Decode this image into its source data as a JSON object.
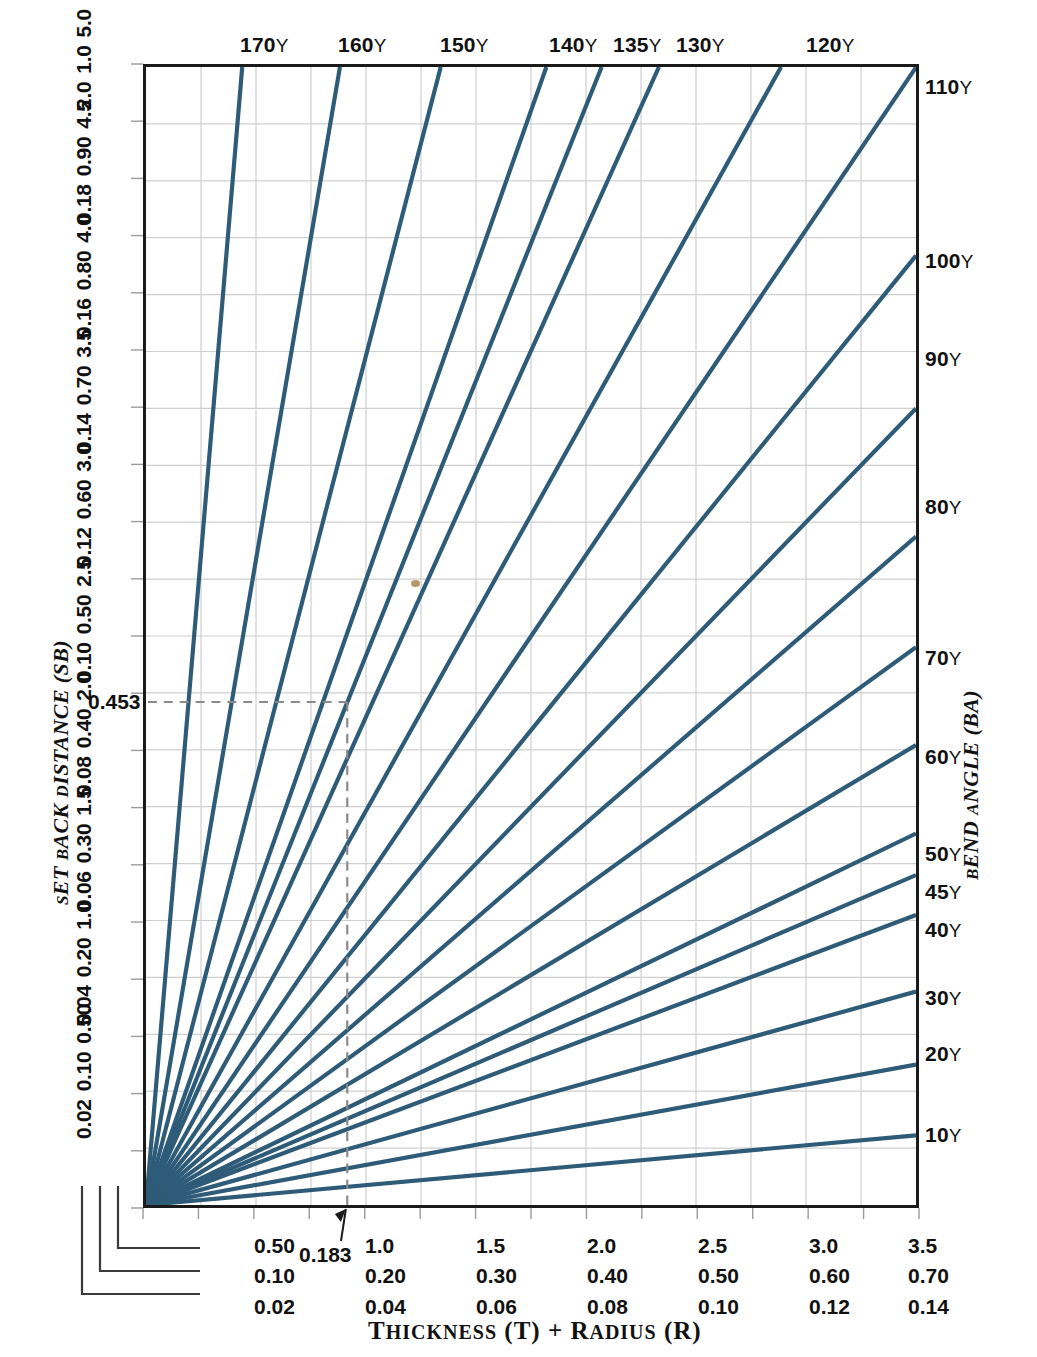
{
  "figure": {
    "x_axis_title": "THICKNESS (T) + RADIUS (R)",
    "y_axis_title": "SET BACK DISTANCE (SB)",
    "right_axis_title": "BEND ANGLE (BA)",
    "degree_symbol": "Υ",
    "line_color": "#2d5b78",
    "grid_color": "#cfcfcf",
    "frame_color": "#1a1a1a",
    "dashed_color": "#8a8a8a"
  },
  "top_labels": [
    {
      "text": "170",
      "deg": "Υ",
      "x": 240
    },
    {
      "text": "160",
      "deg": "Υ",
      "x": 338
    },
    {
      "text": "150",
      "deg": "Υ",
      "x": 440
    },
    {
      "text": "140",
      "deg": "Υ",
      "x": 549
    },
    {
      "text": "135",
      "deg": "Υ",
      "x": 613
    },
    {
      "text": "130",
      "deg": "Υ",
      "x": 676
    },
    {
      "text": "120",
      "deg": "Υ",
      "x": 806
    }
  ],
  "right_labels": [
    {
      "text": "110",
      "deg": "Υ",
      "y": 76
    },
    {
      "text": "100",
      "deg": "Υ",
      "y": 250
    },
    {
      "text": "90",
      "deg": "Υ",
      "y": 348
    },
    {
      "text": "80",
      "deg": "Υ",
      "y": 496
    },
    {
      "text": "70",
      "deg": "Υ",
      "y": 647
    },
    {
      "text": "60",
      "deg": "Υ",
      "y": 746
    },
    {
      "text": "50",
      "deg": "Υ",
      "y": 843
    },
    {
      "text": "45",
      "deg": "Υ",
      "y": 881
    },
    {
      "text": "40",
      "deg": "Υ",
      "y": 919
    },
    {
      "text": "30",
      "deg": "Υ",
      "y": 987
    },
    {
      "text": "20",
      "deg": "Υ",
      "y": 1043
    },
    {
      "text": "10",
      "deg": "Υ",
      "y": 1124
    }
  ],
  "left_scales": [
    {
      "s1": "2.0",
      "s2": "1.0",
      "s3": "5.0",
      "y": 64
    },
    {
      "s1": "0.18",
      "s2": "0.90",
      "s3": "4.5",
      "y": 178
    },
    {
      "s1": "0.16",
      "s2": "0.80",
      "s3": "4.0",
      "y": 292
    },
    {
      "s1": "0.14",
      "s2": "0.70",
      "s3": "3.5",
      "y": 407
    },
    {
      "s1": "0.12",
      "s2": "0.60",
      "s3": "3.0",
      "y": 521
    },
    {
      "s1": "0.10",
      "s2": "0.50",
      "s3": "2.5",
      "y": 636
    },
    {
      "s1": "0.08",
      "s2": "0.40",
      "s3": "2.0",
      "y": 750
    },
    {
      "s1": "0.06",
      "s2": "0.30",
      "s3": "1.5",
      "y": 865
    },
    {
      "s1": "0.04",
      "s2": "0.20",
      "s3": "1.0",
      "y": 979
    },
    {
      "s1": "0.02",
      "s2": "0.10",
      "s3": "0.50",
      "y": 1093
    }
  ],
  "left_callout": {
    "value": "0.453",
    "y": 700
  },
  "bottom_scales": [
    {
      "s1": "0.50",
      "s2": "0.10",
      "s3": "0.02",
      "x": 254
    },
    {
      "s1": "1.0",
      "s2": "0.20",
      "s3": "0.04",
      "x": 365
    },
    {
      "s1": "1.5",
      "s2": "0.30",
      "s3": "0.06",
      "x": 476
    },
    {
      "s1": "2.0",
      "s2": "0.40",
      "s3": "0.08",
      "x": 587
    },
    {
      "s1": "2.5",
      "s2": "0.50",
      "s3": "0.10",
      "x": 698
    },
    {
      "s1": "3.0",
      "s2": "0.60",
      "s3": "0.12",
      "x": 809
    },
    {
      "s1": "3.5",
      "s2": "0.70",
      "s3": "0.14",
      "x": 908
    }
  ],
  "bottom_callout": {
    "value": "0.183",
    "x": 299
  },
  "chart_data": {
    "type": "line",
    "title": "",
    "xlabel": "THICKNESS (T) + RADIUS (R)",
    "ylabel": "SET BACK DISTANCE (SB)",
    "y2label": "BEND ANGLE (BA)",
    "xlim": [
      0,
      3.5
    ],
    "ylim": [
      0,
      5.0
    ],
    "grid": true,
    "legend": "none",
    "x_scales": {
      "primary_ticks": [
        "0.50",
        "1.0",
        "1.5",
        "2.0",
        "2.5",
        "3.0",
        "3.5"
      ],
      "secondary_ticks": [
        "0.10",
        "0.20",
        "0.30",
        "0.40",
        "0.50",
        "0.60",
        "0.70"
      ],
      "tertiary_ticks": [
        "0.02",
        "0.04",
        "0.06",
        "0.08",
        "0.10",
        "0.12",
        "0.14"
      ]
    },
    "y_scales": {
      "primary_ticks": [
        "0.02",
        "0.04",
        "0.06",
        "0.08",
        "0.10",
        "0.12",
        "0.14",
        "0.16",
        "0.18",
        "2.0"
      ],
      "secondary_ticks": [
        "0.10",
        "0.20",
        "0.30",
        "0.40",
        "0.50",
        "0.60",
        "0.70",
        "0.80",
        "0.90",
        "1.0"
      ],
      "tertiary_ticks": [
        "0.50",
        "1.0",
        "1.5",
        "2.0",
        "2.5",
        "3.0",
        "3.5",
        "4.0",
        "4.5",
        "5.0"
      ]
    },
    "series": [
      {
        "name": "170Υ",
        "bend_angle": 170,
        "slope": 11.4301,
        "label_side": "top"
      },
      {
        "name": "160Υ",
        "bend_angle": 160,
        "slope": 5.6713,
        "label_side": "top"
      },
      {
        "name": "150Υ",
        "bend_angle": 150,
        "slope": 3.7321,
        "label_side": "top"
      },
      {
        "name": "140Υ",
        "bend_angle": 140,
        "slope": 2.7475,
        "label_side": "top"
      },
      {
        "name": "135Υ",
        "bend_angle": 135,
        "slope": 2.4142,
        "label_side": "top"
      },
      {
        "name": "130Υ",
        "bend_angle": 130,
        "slope": 2.1445,
        "label_side": "top"
      },
      {
        "name": "120Υ",
        "bend_angle": 120,
        "slope": 1.7321,
        "label_side": "top"
      },
      {
        "name": "110Υ",
        "bend_angle": 110,
        "slope": 1.4281,
        "label_side": "right"
      },
      {
        "name": "100Υ",
        "bend_angle": 100,
        "slope": 1.1918,
        "label_side": "right"
      },
      {
        "name": "90Υ",
        "bend_angle": 90,
        "slope": 1.0,
        "label_side": "right"
      },
      {
        "name": "80Υ",
        "bend_angle": 80,
        "slope": 0.8391,
        "label_side": "right"
      },
      {
        "name": "70Υ",
        "bend_angle": 70,
        "slope": 0.7002,
        "label_side": "right"
      },
      {
        "name": "60Υ",
        "bend_angle": 60,
        "slope": 0.5774,
        "label_side": "right"
      },
      {
        "name": "50Υ",
        "bend_angle": 50,
        "slope": 0.4663,
        "label_side": "right"
      },
      {
        "name": "45Υ",
        "bend_angle": 45,
        "slope": 0.4142,
        "label_side": "right"
      },
      {
        "name": "40Υ",
        "bend_angle": 40,
        "slope": 0.364,
        "label_side": "right"
      },
      {
        "name": "30Υ",
        "bend_angle": 30,
        "slope": 0.2679,
        "label_side": "right"
      },
      {
        "name": "20Υ",
        "bend_angle": 20,
        "slope": 0.1763,
        "label_side": "right"
      },
      {
        "name": "10Υ",
        "bend_angle": 10,
        "slope": 0.0875,
        "label_side": "right"
      }
    ],
    "annotations": [
      {
        "type": "v-dashed",
        "label": "0.183",
        "x_value": 0.915,
        "note": "vertical reference at T+R reading 0.183 on tertiary scale"
      },
      {
        "type": "h-dashed",
        "label": "0.453",
        "y_value": 2.21,
        "note": "horizontal reference at SB reading 0.453"
      }
    ]
  }
}
